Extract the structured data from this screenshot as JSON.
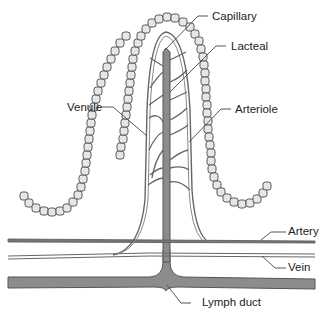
{
  "diagram": {
    "type": "anatomical illustration",
    "colors": {
      "background": "#ffffff",
      "outline": "#555555",
      "vessel_fill": "#8c8c8c",
      "cell_fill": "#e6e6e6",
      "label_text": "#222222",
      "leader_line": "#444444"
    },
    "labels": [
      {
        "id": "capillary",
        "text": "Capillary"
      },
      {
        "id": "lacteal",
        "text": "Lacteal"
      },
      {
        "id": "venule",
        "text": "Venule"
      },
      {
        "id": "arteriole",
        "text": "Arteriole"
      },
      {
        "id": "artery",
        "text": "Artery"
      },
      {
        "id": "vein",
        "text": "Vein"
      },
      {
        "id": "lymph_duct",
        "text": "Lymph duct"
      }
    ]
  }
}
